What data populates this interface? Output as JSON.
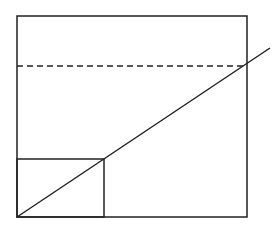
{
  "diagram": {
    "width": 280,
    "height": 232,
    "stroke_color": "#222222",
    "background": "#ffffff",
    "outer_rect": {
      "x": 17,
      "y": 16,
      "w": 230,
      "h": 201
    },
    "inner_rect": {
      "x": 17,
      "y": 159,
      "w": 87,
      "h": 58
    },
    "dashed_line": {
      "x1": 17,
      "y1": 66,
      "x2": 247,
      "y2": 66,
      "dash": "6,4"
    },
    "diagonal_line": {
      "x1": 17,
      "y1": 217,
      "x2": 270,
      "y2": 48
    }
  }
}
